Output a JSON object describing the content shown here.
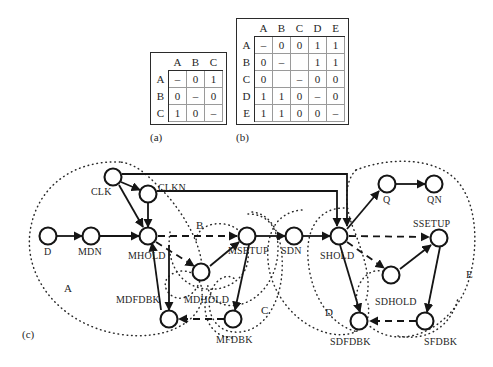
{
  "figure": {
    "panels": [
      {
        "id": "a",
        "caption": "(a)"
      },
      {
        "id": "b",
        "caption": "(b)"
      },
      {
        "id": "c",
        "caption": "(c)"
      }
    ]
  },
  "table_a": {
    "caption": "(a)",
    "col_headers": [
      "A",
      "B",
      "C"
    ],
    "row_headers": [
      "A",
      "B",
      "C"
    ],
    "rows": [
      [
        "–",
        "0",
        "1"
      ],
      [
        "0",
        "–",
        "0"
      ],
      [
        "1",
        "0",
        "–"
      ]
    ]
  },
  "table_b": {
    "caption": "(b)",
    "col_headers": [
      "A",
      "B",
      "C",
      "D",
      "E"
    ],
    "row_headers": [
      "A",
      "B",
      "C",
      "D",
      "E"
    ],
    "rows": [
      [
        "–",
        "0",
        "0",
        "1",
        "1"
      ],
      [
        "0",
        "–",
        "",
        "1",
        "1"
      ],
      [
        "0",
        "",
        "–",
        "0",
        "0"
      ],
      [
        "1",
        "1",
        "0",
        "–",
        "0"
      ],
      [
        "1",
        "1",
        "0",
        "0",
        "–"
      ]
    ]
  },
  "graph": {
    "caption": "(c)",
    "nodes": [
      {
        "id": "D",
        "label": "D",
        "x": 48,
        "y": 88,
        "label_dx": -4,
        "label_dy": 20
      },
      {
        "id": "MDN",
        "label": "MDN",
        "x": 91,
        "y": 88,
        "label_dx": -13,
        "label_dy": 20
      },
      {
        "id": "MHOLD",
        "label": "MHOLD",
        "x": 148,
        "y": 88,
        "label_dx": -20,
        "label_dy": 24
      },
      {
        "id": "CLK",
        "label": "CLK",
        "x": 113,
        "y": 29,
        "label_dx": -22,
        "label_dy": 18
      },
      {
        "id": "CLKN",
        "label": "CLKN",
        "x": 148,
        "y": 46,
        "label_dx": 9,
        "label_dy": -4
      },
      {
        "id": "MDHOLD",
        "label": "MDHOLD",
        "x": 201,
        "y": 124,
        "label_dx": -17,
        "label_dy": 30
      },
      {
        "id": "MSETUP",
        "label": "MSETUP",
        "x": 247,
        "y": 88,
        "label_dx": -15,
        "label_dy": 19
      },
      {
        "id": "MDFDBK",
        "label": "MDFDBK",
        "x": 169,
        "y": 171,
        "label_dx": -50,
        "label_dy": -8
      },
      {
        "id": "MFDBK",
        "label": "MFDBK",
        "x": 233,
        "y": 171,
        "label_dx": -16,
        "label_dy": 22
      },
      {
        "id": "SDN",
        "label": "SDN",
        "x": 294,
        "y": 88,
        "label_dx": -13,
        "label_dy": 19
      },
      {
        "id": "SHOLD",
        "label": "SHOLD",
        "x": 339,
        "y": 88,
        "label_dx": -18,
        "label_dy": 24
      },
      {
        "id": "Q",
        "label": "Q",
        "x": 387,
        "y": 36,
        "label_dx": -3,
        "label_dy": 20
      },
      {
        "id": "QN",
        "label": "QN",
        "x": 434,
        "y": 36,
        "label_dx": -7,
        "label_dy": 20
      },
      {
        "id": "SSETUP",
        "label": "SSETUP",
        "x": 439,
        "y": 90,
        "label_dx": -20,
        "label_dy": -15
      },
      {
        "id": "SDHOLD",
        "label": "SDHOLD",
        "x": 391,
        "y": 127,
        "label_dx": -13,
        "label_dy": 28
      },
      {
        "id": "SDFDBK",
        "label": "SDFDBK",
        "x": 359,
        "y": 173,
        "label_dx": -25,
        "label_dy": 25
      },
      {
        "id": "SFDBK",
        "label": "SFDBK",
        "x": 425,
        "y": 173,
        "label_dx": 3,
        "label_dy": 25
      }
    ],
    "region_labels": [
      {
        "id": "A",
        "label": "A",
        "x": 67,
        "y": 141
      },
      {
        "id": "B",
        "label": "B",
        "x": 198,
        "y": 79
      },
      {
        "id": "C",
        "label": "C",
        "x": 263,
        "y": 163
      },
      {
        "id": "D",
        "label": "D",
        "x": 327,
        "y": 166
      },
      {
        "id": "E",
        "label": "E",
        "x": 468,
        "y": 127
      }
    ],
    "edge_styles": {
      "solid": "solid arrow",
      "dashed": "dashed arrow",
      "region": "dotted enclosure"
    }
  },
  "colors": {
    "ink": "#1a1a1a",
    "rule": "#2b2b2b",
    "grid": "#9a9a9a",
    "background": "#ffffff"
  }
}
